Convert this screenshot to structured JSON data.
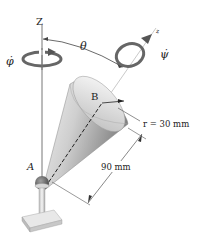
{
  "diagram": {
    "labels": {
      "z_axis": "Z",
      "z_body_axis": "z",
      "theta": "θ",
      "phi_dot": "φ̇",
      "psi_dot": "ψ̇",
      "point_a": "A",
      "point_b": "B",
      "radius": "r = 30 mm",
      "length": "90 mm"
    },
    "colors": {
      "line": "#555555",
      "arrow_ring": "#666666",
      "cone_light": "#e8e8e8",
      "cone_dark": "#8a8a8a",
      "ball": "#6b6b6b",
      "base": "#d9d9d9"
    },
    "dimensions": {
      "radius_mm": 30,
      "length_mm": 90
    }
  }
}
